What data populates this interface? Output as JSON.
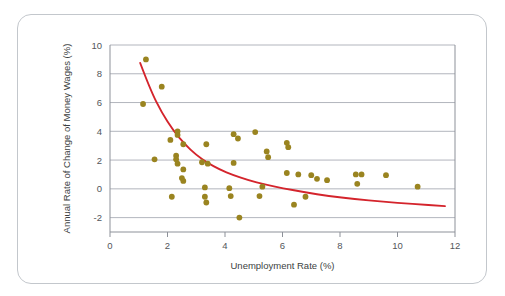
{
  "chart_data": {
    "type": "scatter",
    "title": "",
    "xlabel": "Unemployment Rate (%)",
    "ylabel": "Annual Rate of Change of Money Wages (%)",
    "xlim": [
      0,
      12
    ],
    "ylim": [
      -3,
      10
    ],
    "xticks": [
      0,
      2,
      4,
      6,
      8,
      10,
      12
    ],
    "xticklabels": [
      "0",
      "2",
      "4",
      "6",
      "8",
      "10",
      "12"
    ],
    "yticks": [
      -2,
      0,
      2,
      4,
      6,
      8,
      10
    ],
    "yticklabels": [
      "-2",
      "0",
      "2",
      "4",
      "6",
      "8",
      "10"
    ],
    "grid": "horizontal",
    "legend": "none",
    "point_color": "#9a8420",
    "curve_color": "#d4242c",
    "axis_color": "#8d9199",
    "grid_color": "#a9adb5",
    "frame_color": "#c3c7cc",
    "series": [
      {
        "name": "Observations",
        "marker": "circle",
        "points": [
          [
            1.25,
            9.0
          ],
          [
            1.15,
            5.9
          ],
          [
            1.8,
            7.1
          ],
          [
            2.35,
            4.0
          ],
          [
            2.35,
            3.75
          ],
          [
            2.1,
            3.4
          ],
          [
            2.55,
            3.1
          ],
          [
            3.35,
            3.1
          ],
          [
            4.3,
            3.8
          ],
          [
            1.55,
            2.05
          ],
          [
            2.3,
            2.3
          ],
          [
            2.3,
            2.05
          ],
          [
            2.35,
            1.75
          ],
          [
            2.55,
            1.35
          ],
          [
            2.5,
            0.75
          ],
          [
            2.55,
            0.55
          ],
          [
            3.2,
            1.85
          ],
          [
            3.4,
            1.75
          ],
          [
            4.3,
            1.8
          ],
          [
            5.05,
            3.95
          ],
          [
            2.15,
            -0.55
          ],
          [
            3.3,
            0.1
          ],
          [
            3.3,
            -0.55
          ],
          [
            3.35,
            -0.95
          ],
          [
            4.15,
            0.05
          ],
          [
            4.2,
            -0.5
          ],
          [
            4.5,
            -2.0
          ],
          [
            4.45,
            3.5
          ],
          [
            5.45,
            2.6
          ],
          [
            5.5,
            2.2
          ],
          [
            6.15,
            3.2
          ],
          [
            6.2,
            2.9
          ],
          [
            6.15,
            1.1
          ],
          [
            5.2,
            -0.5
          ],
          [
            5.3,
            0.15
          ],
          [
            6.4,
            -1.1
          ],
          [
            6.55,
            1.0
          ],
          [
            6.8,
            -0.55
          ],
          [
            7.0,
            0.95
          ],
          [
            7.2,
            0.7
          ],
          [
            7.55,
            0.6
          ],
          [
            8.55,
            1.0
          ],
          [
            8.75,
            1.0
          ],
          [
            8.6,
            0.35
          ],
          [
            9.6,
            0.95
          ],
          [
            10.7,
            0.15
          ]
        ]
      }
    ],
    "fitted_curve": {
      "name": "Phillips curve",
      "color": "#d4242c",
      "points": [
        [
          1.05,
          8.75
        ],
        [
          1.4,
          6.9
        ],
        [
          1.8,
          5.3
        ],
        [
          2.2,
          4.05
        ],
        [
          2.6,
          3.1
        ],
        [
          3.0,
          2.35
        ],
        [
          3.4,
          1.8
        ],
        [
          3.8,
          1.35
        ],
        [
          4.3,
          0.95
        ],
        [
          4.8,
          0.6
        ],
        [
          5.4,
          0.3
        ],
        [
          6.0,
          0.05
        ],
        [
          6.8,
          -0.25
        ],
        [
          7.6,
          -0.5
        ],
        [
          8.5,
          -0.7
        ],
        [
          9.5,
          -0.9
        ],
        [
          10.5,
          -1.05
        ],
        [
          11.65,
          -1.2
        ]
      ]
    }
  }
}
